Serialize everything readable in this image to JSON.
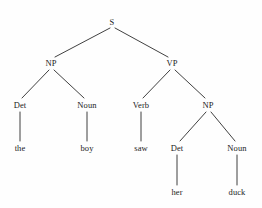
{
  "diagram": {
    "type": "syntax-tree",
    "sentence": "the boy saw her duck",
    "stroke_color": "#2b2b2b",
    "text_color": "#1c1c1c",
    "background_color": "#fefefe",
    "nodes": [
      {
        "id": "s",
        "label": "S",
        "kind": "category",
        "x": 112,
        "y": 22
      },
      {
        "id": "np1",
        "label": "NP",
        "kind": "category",
        "x": 51,
        "y": 63
      },
      {
        "id": "vp",
        "label": "VP",
        "kind": "category",
        "x": 172,
        "y": 63
      },
      {
        "id": "det1",
        "label": "Det",
        "kind": "category",
        "x": 20,
        "y": 105
      },
      {
        "id": "noun1",
        "label": "Noun",
        "kind": "category",
        "x": 87,
        "y": 105
      },
      {
        "id": "verb",
        "label": "Verb",
        "kind": "category",
        "x": 141,
        "y": 105
      },
      {
        "id": "np2",
        "label": "NP",
        "kind": "category",
        "x": 208,
        "y": 105
      },
      {
        "id": "the",
        "label": "the",
        "kind": "word",
        "x": 20,
        "y": 148
      },
      {
        "id": "boy",
        "label": "boy",
        "kind": "word",
        "x": 87,
        "y": 148
      },
      {
        "id": "saw",
        "label": "saw",
        "kind": "word",
        "x": 141,
        "y": 148
      },
      {
        "id": "det2",
        "label": "Det",
        "kind": "category",
        "x": 177,
        "y": 148
      },
      {
        "id": "noun2",
        "label": "Noun",
        "kind": "category",
        "x": 237,
        "y": 148
      },
      {
        "id": "her",
        "label": "her",
        "kind": "word",
        "x": 177,
        "y": 192
      },
      {
        "id": "duck",
        "label": "duck",
        "kind": "word",
        "x": 237,
        "y": 192
      }
    ],
    "edges": [
      {
        "from": "s",
        "to": "np1",
        "x1": 110,
        "y1": 28,
        "x2": 55,
        "y2": 57
      },
      {
        "from": "s",
        "to": "vp",
        "x1": 115,
        "y1": 28,
        "x2": 168,
        "y2": 57
      },
      {
        "from": "np1",
        "to": "det1",
        "x1": 49,
        "y1": 70,
        "x2": 22,
        "y2": 98
      },
      {
        "from": "np1",
        "to": "noun1",
        "x1": 54,
        "y1": 70,
        "x2": 84,
        "y2": 98
      },
      {
        "from": "vp",
        "to": "verb",
        "x1": 170,
        "y1": 70,
        "x2": 143,
        "y2": 98
      },
      {
        "from": "vp",
        "to": "np2",
        "x1": 175,
        "y1": 70,
        "x2": 205,
        "y2": 98
      },
      {
        "from": "det1",
        "to": "the",
        "x1": 20,
        "y1": 112,
        "x2": 20,
        "y2": 141
      },
      {
        "from": "noun1",
        "to": "boy",
        "x1": 87,
        "y1": 112,
        "x2": 87,
        "y2": 141
      },
      {
        "from": "verb",
        "to": "saw",
        "x1": 141,
        "y1": 112,
        "x2": 141,
        "y2": 141
      },
      {
        "from": "np2",
        "to": "det2",
        "x1": 206,
        "y1": 112,
        "x2": 180,
        "y2": 141
      },
      {
        "from": "np2",
        "to": "noun2",
        "x1": 211,
        "y1": 112,
        "x2": 235,
        "y2": 141
      },
      {
        "from": "det2",
        "to": "her",
        "x1": 177,
        "y1": 155,
        "x2": 177,
        "y2": 185
      },
      {
        "from": "noun2",
        "to": "duck",
        "x1": 237,
        "y1": 155,
        "x2": 237,
        "y2": 185
      }
    ]
  }
}
